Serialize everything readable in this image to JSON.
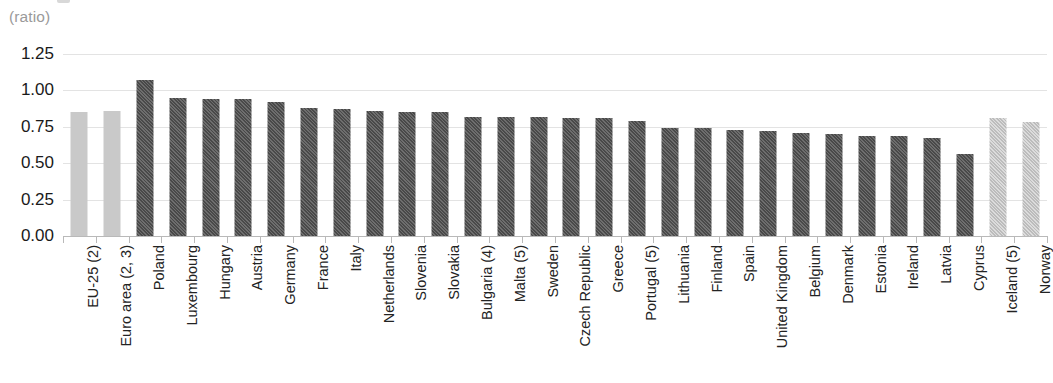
{
  "unit_label": "(ratio)",
  "chart_data": {
    "type": "bar",
    "title": "",
    "subtitle": "",
    "xlabel": "",
    "ylabel": "(ratio)",
    "ylim": [
      0.0,
      1.25
    ],
    "yticks": [
      "0.00",
      "0.25",
      "0.50",
      "0.75",
      "1.00",
      "1.25"
    ],
    "ytick_values": [
      0.0,
      0.25,
      0.5,
      0.75,
      1.0,
      1.25
    ],
    "grid": true,
    "legend": "none",
    "categories": [
      "EU-25 (2)",
      "Euro area (2, 3)",
      "Poland",
      "Luxembourg",
      "Hungary",
      "Austria",
      "Germany",
      "France",
      "Italy",
      "Netherlands",
      "Slovenia",
      "Slovakia",
      "Bulgaria (4)",
      "Malta (5)",
      "Sweden",
      "Czech Republic",
      "Greece",
      "Portugal (5)",
      "Lithuania",
      "Finland",
      "Spain",
      "United Kingdom",
      "Belgium",
      "Denmark",
      "Estonia",
      "Ireland",
      "Latvia",
      "Cyprus",
      "Iceland (5)",
      "Norway"
    ],
    "values": [
      0.85,
      0.86,
      1.07,
      0.95,
      0.94,
      0.94,
      0.92,
      0.88,
      0.87,
      0.86,
      0.85,
      0.85,
      0.82,
      0.82,
      0.82,
      0.81,
      0.81,
      0.79,
      0.74,
      0.74,
      0.73,
      0.72,
      0.71,
      0.7,
      0.69,
      0.69,
      0.67,
      0.56,
      0.81,
      0.78
    ],
    "bar_styles": [
      "solid-light",
      "solid-light",
      "hatch-dark",
      "hatch-dark",
      "hatch-dark",
      "hatch-dark",
      "hatch-dark",
      "hatch-dark",
      "hatch-dark",
      "hatch-dark",
      "hatch-dark",
      "hatch-dark",
      "hatch-dark",
      "hatch-dark",
      "hatch-dark",
      "hatch-dark",
      "hatch-dark",
      "hatch-dark",
      "hatch-dark",
      "hatch-dark",
      "hatch-dark",
      "hatch-dark",
      "hatch-dark",
      "hatch-dark",
      "hatch-dark",
      "hatch-dark",
      "hatch-dark",
      "hatch-dark",
      "hatch-light",
      "hatch-light"
    ]
  },
  "colors": {
    "aggregate_bar": "#c9c9c9",
    "country_bar": "#4f4f4f",
    "nonmember_bar": "#c4c4c4",
    "gridline": "#e3e3e3",
    "axis": "#b9b9b9",
    "label_text": "#232323",
    "unit_text": "#9a9a9a"
  }
}
